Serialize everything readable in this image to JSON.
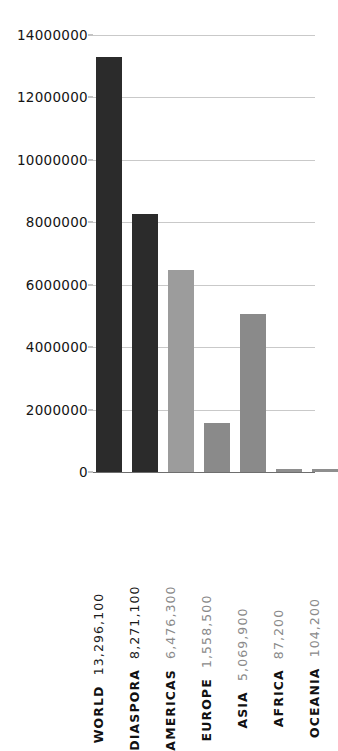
{
  "chart_data": {
    "type": "bar",
    "title": "",
    "subtitle": "",
    "xlabel": "",
    "ylabel": "",
    "grid": true,
    "legend": null,
    "ylim": [
      0,
      14000000
    ],
    "ytick_values": [
      0,
      2000000,
      4000000,
      6000000,
      8000000,
      10000000,
      12000000,
      14000000
    ],
    "ytick_labels": [
      "0",
      "2000000",
      "4000000",
      "6000000",
      "8000000",
      "10000000",
      "12000000",
      "14000000"
    ],
    "categories": [
      "WORLD",
      "DIASPORA",
      "AMERICAS",
      "EUROPE",
      "ASIA",
      "AFRICA",
      "OCEANIA"
    ],
    "values": [
      13296100,
      8271100,
      6476300,
      1558500,
      5069900,
      87200,
      104200
    ],
    "value_labels": [
      "13,296,100",
      "8,271,100",
      "6,476,300",
      "1,558,500",
      "5,069,900",
      "87,200",
      "104,200"
    ],
    "bar_colors": [
      "#2b2b2b",
      "#2b2b2b",
      "#9c9c9c",
      "#8a8a8a",
      "#8a8a8a",
      "#8e8e8e",
      "#8e8e8e"
    ],
    "label_value_colors": [
      "#1a1a1a",
      "#1a1a1a",
      "#8a8a8a",
      "#8a8a8a",
      "#8a8a8a",
      "#8a8a8a",
      "#8a8a8a"
    ],
    "label_name_colors": [
      "#111111",
      "#111111",
      "#111111",
      "#111111",
      "#111111",
      "#111111",
      "#111111"
    ]
  },
  "axis": {
    "gridline_color": "#c9c9c9",
    "baseline_color": "#6e6e6e"
  }
}
